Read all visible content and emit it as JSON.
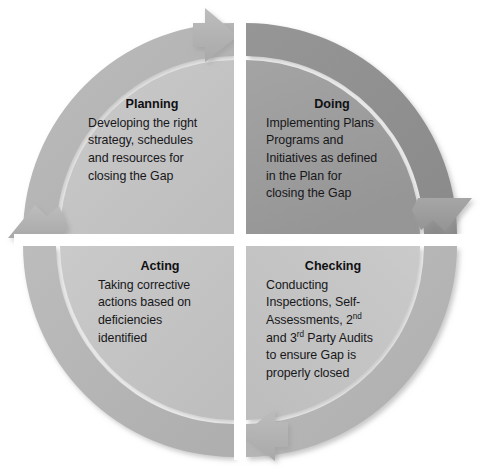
{
  "diagram": {
    "name": "PDCA Cycle",
    "type": "four-quadrant-cycle",
    "direction": "clockwise",
    "colors": {
      "background": "#ffffff",
      "inner_light": "#c4c4c4",
      "inner_dark": "#9c9c9c",
      "ring_light": "#b4b4b4",
      "ring_dark": "#8e8e8e",
      "arrow_light": "#b0b0b0",
      "arrow_dark": "#9a9a9a",
      "shadow": "#d9d9d9",
      "text": "#17171a"
    },
    "quadrants": [
      {
        "id": "planning",
        "position": "top-left",
        "title": "Planning",
        "body_lines": [
          "Developing the right",
          "strategy, schedules",
          "and resources for",
          "closing the Gap"
        ],
        "shade": "light"
      },
      {
        "id": "doing",
        "position": "top-right",
        "title": "Doing",
        "body_lines": [
          "Implementing Plans",
          "Programs and",
          "Initiatives as defined",
          "in the Plan for",
          "closing the Gap"
        ],
        "shade": "dark"
      },
      {
        "id": "checking",
        "position": "bottom-right",
        "title": "Checking",
        "body_lines": [
          "Conducting",
          "Inspections, Self-",
          "Assessments, 2nd",
          "and 3rd Party Audits",
          "to ensure Gap is",
          "properly closed"
        ],
        "shade": "light"
      },
      {
        "id": "acting",
        "position": "bottom-left",
        "title": "Acting",
        "body_lines": [
          "Taking corrective",
          "actions based on",
          "deficiencies",
          "identified"
        ],
        "shade": "light"
      }
    ],
    "arrows": [
      {
        "id": "arrow-top",
        "points": "right",
        "location": "top-center",
        "icon": "arrow-right-icon"
      },
      {
        "id": "arrow-right",
        "points": "down",
        "location": "right-center",
        "icon": "arrow-down-icon"
      },
      {
        "id": "arrow-bottom",
        "points": "left",
        "location": "bottom-center",
        "icon": "arrow-left-icon"
      },
      {
        "id": "arrow-left",
        "points": "up",
        "location": "left-center",
        "icon": "arrow-up-icon"
      }
    ]
  }
}
